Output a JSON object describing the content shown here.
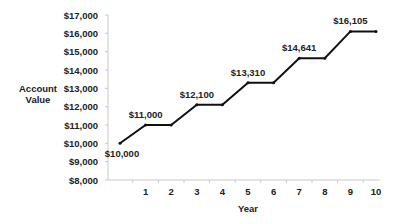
{
  "chart_data": {
    "type": "line",
    "title": "",
    "xlabel": "Year",
    "ylabel": "Account Value",
    "ylabel_lines": [
      "Account",
      "Value"
    ],
    "ylim": [
      8000,
      17000
    ],
    "xlim": [
      0,
      10
    ],
    "y_ticks": [
      "$8,000",
      "$9,000",
      "$10,000",
      "$11,000",
      "$12,000",
      "$13,000",
      "$14,000",
      "$15,000",
      "$16,000",
      "$17,000"
    ],
    "y_tick_values": [
      8000,
      9000,
      10000,
      11000,
      12000,
      13000,
      14000,
      15000,
      16000,
      17000
    ],
    "x_ticks": [
      "1",
      "2",
      "3",
      "4",
      "5",
      "6",
      "7",
      "8",
      "9",
      "10"
    ],
    "x": [
      0,
      1,
      2,
      3,
      4,
      5,
      6,
      7,
      8,
      9,
      10
    ],
    "series": [
      {
        "name": "Account Value",
        "values": [
          10000,
          11000,
          11000,
          12100,
          12100,
          13310,
          13310,
          14641,
          14641,
          16105,
          16105
        ],
        "color": "#111111"
      }
    ],
    "annotations": [
      {
        "x": 0,
        "y": 10000,
        "text": "$10,000"
      },
      {
        "x": 1,
        "y": 11000,
        "text": "$11,000"
      },
      {
        "x": 3,
        "y": 12100,
        "text": "$12,100"
      },
      {
        "x": 5,
        "y": 13310,
        "text": "$13,310"
      },
      {
        "x": 7,
        "y": 14641,
        "text": "$14,641"
      },
      {
        "x": 9,
        "y": 16105,
        "text": "$16,105"
      }
    ],
    "grid": false,
    "legend": "none"
  }
}
